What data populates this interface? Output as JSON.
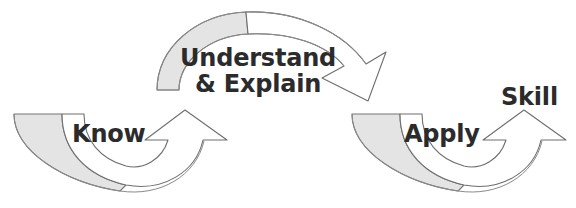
{
  "diagram": {
    "type": "cycle-flow",
    "background_color": "#ffffff",
    "ribbon_fill_shaded": "#e4e4e4",
    "ribbon_fill_light": "#ffffff",
    "ribbon_stroke": "#6e6e6e",
    "text_color": "#2b2b2b",
    "stages": [
      {
        "id": "know",
        "label": "Know",
        "order": 1
      },
      {
        "id": "understand-explain",
        "label": "Understand",
        "label_line2": "& Explain",
        "order": 2
      },
      {
        "id": "apply",
        "label": "Apply",
        "order": 3
      },
      {
        "id": "skill",
        "label": "Skill",
        "order": 4
      }
    ],
    "connectors": [
      {
        "id": "know-to-understand",
        "shape": "u-curve-up-right",
        "from": "know",
        "to": "understand-explain"
      },
      {
        "id": "understand-to-apply",
        "shape": "arch-down-right",
        "from": "understand-explain",
        "to": "apply"
      },
      {
        "id": "apply-to-skill",
        "shape": "u-curve-up-right",
        "from": "apply",
        "to": "skill"
      }
    ]
  }
}
